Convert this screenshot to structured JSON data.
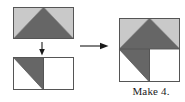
{
  "diagram": {
    "kind": "quilt-block-assembly",
    "caption": "Make 4.",
    "colors": {
      "dark_fabric": "#666666",
      "light_fabric": "#c9c9c9",
      "background_fabric": "#ffffff",
      "outline": "#555555",
      "arrow": "#1a1a1a",
      "caption_text": "#1a1a1a"
    },
    "steps": [
      {
        "id": "flying-geese-unit",
        "label": "Flying geese unit",
        "position": {
          "x": 13,
          "y": 7,
          "width": 61,
          "height": 32
        },
        "patches": [
          {
            "name": "center-goose-triangle",
            "fabric": "dark"
          },
          {
            "name": "left-corner-triangle",
            "fabric": "light"
          },
          {
            "name": "right-corner-triangle",
            "fabric": "light"
          }
        ]
      },
      {
        "id": "two-square-unit",
        "label": "Half-square triangle plus background square",
        "position": {
          "x": 13,
          "y": 57,
          "width": 61,
          "height": 33
        },
        "patches": [
          {
            "name": "half-square-triangle-dark",
            "fabric": "dark"
          },
          {
            "name": "half-square-triangle-light",
            "fabric": "background"
          },
          {
            "name": "background-square",
            "fabric": "background"
          }
        ]
      },
      {
        "id": "assembled-block",
        "label": "Assembled block",
        "position": {
          "x": 119,
          "y": 18,
          "width": 61,
          "height": 64
        },
        "patches": [
          {
            "name": "center-goose-triangle",
            "fabric": "dark"
          },
          {
            "name": "left-corner-triangle",
            "fabric": "light"
          },
          {
            "name": "right-corner-triangle",
            "fabric": "light"
          },
          {
            "name": "half-square-triangle-dark",
            "fabric": "dark"
          },
          {
            "name": "half-square-triangle-light",
            "fabric": "background"
          },
          {
            "name": "background-square",
            "fabric": "background"
          }
        ]
      }
    ],
    "arrows": [
      {
        "id": "down-arrow",
        "direction": "down",
        "from": "flying-geese-unit",
        "to": "two-square-unit"
      },
      {
        "id": "right-arrow",
        "direction": "right",
        "from": "two-square-unit",
        "to": "assembled-block"
      }
    ]
  }
}
